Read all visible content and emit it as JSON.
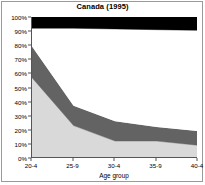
{
  "chart_data": {
    "type": "area",
    "title": "Canada (1995)",
    "xlabel": "Age group",
    "ylabel": "",
    "categories": [
      "20-4",
      "25-9",
      "30-4",
      "35-9",
      "40-4"
    ],
    "ylim": [
      0,
      100
    ],
    "ytick_labels": [
      "0%",
      "10%",
      "20%",
      "30%",
      "40%",
      "50%",
      "60%",
      "70%",
      "80%",
      "90%",
      "100%"
    ],
    "ytick_values": [
      0,
      10,
      20,
      30,
      40,
      50,
      60,
      70,
      80,
      90,
      100
    ],
    "grid": false,
    "legend": "none",
    "stacked": true,
    "series": [
      {
        "name": "band-1-light-gray",
        "color": "#d9d9d9",
        "values": [
          57,
          23,
          12,
          12,
          9
        ],
        "cumulative_top": [
          57,
          23,
          12,
          12,
          9
        ]
      },
      {
        "name": "band-2-dark-gray",
        "color": "#636363",
        "values": [
          22,
          14,
          14,
          10,
          10
        ],
        "cumulative_top": [
          79,
          37,
          26,
          22,
          19
        ]
      },
      {
        "name": "band-3-white",
        "color": "#ffffff",
        "values": [
          13,
          55,
          65.5,
          69,
          71.5
        ],
        "cumulative_top": [
          92,
          92,
          91.5,
          91,
          90.5
        ]
      },
      {
        "name": "band-4-black",
        "color": "#000000",
        "values": [
          8,
          8,
          8.5,
          9,
          9.5
        ],
        "cumulative_top": [
          100,
          100,
          100,
          100,
          100
        ]
      }
    ]
  },
  "figure": {
    "title": "Canada (1995)",
    "axis_color": "#555555",
    "border_color": "#9a9a9a",
    "background": "#ffffff"
  }
}
